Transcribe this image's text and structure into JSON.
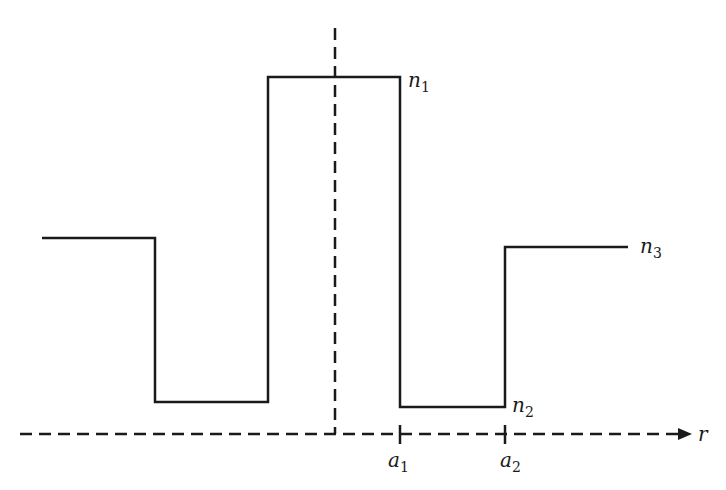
{
  "diagram": {
    "type": "refractive-index-profile",
    "axis": {
      "label": "r",
      "style": "dashed",
      "arrow": "right"
    },
    "center_line": {
      "style": "dashed",
      "orientation": "vertical"
    },
    "levels": [
      {
        "name": "n1",
        "base": "n",
        "sub": "1"
      },
      {
        "name": "n2",
        "base": "n",
        "sub": "2"
      },
      {
        "name": "n3",
        "base": "n",
        "sub": "3"
      }
    ],
    "ticks": [
      {
        "name": "a1",
        "base": "a",
        "sub": "1"
      },
      {
        "name": "a2",
        "base": "a",
        "sub": "2"
      }
    ],
    "line_color": "#1a1a1a"
  }
}
